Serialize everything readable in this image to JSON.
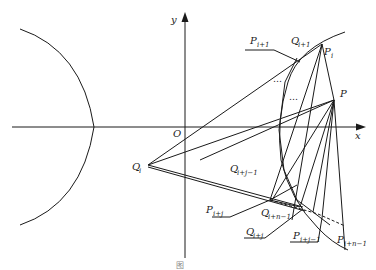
{
  "figure": {
    "axes": {
      "x_label": "x",
      "y_label": "y",
      "origin_label": "O"
    },
    "points": {
      "P": "P",
      "Pi": {
        "base": "P",
        "sub": "i"
      },
      "Pi1": {
        "base": "P",
        "sub": "i+1"
      },
      "Qi1": {
        "base": "Q",
        "sub": "i+1"
      },
      "Qi": {
        "base": "Q",
        "sub": "i"
      },
      "Qij1": {
        "base": "Q",
        "sub": "i+j−1"
      },
      "Pij": {
        "base": "P",
        "sub": "i+j"
      },
      "Qin1": {
        "base": "Q",
        "sub": "i+n−1"
      },
      "Qij": {
        "base": "Q",
        "sub": "i+j"
      },
      "Pij1": {
        "base": "P",
        "sub": "i+j−1"
      },
      "Pin1": {
        "base": "P",
        "sub": "i+n−1"
      }
    },
    "ellipsis_1": "…",
    "ellipsis_2": "…",
    "caption": "图"
  }
}
